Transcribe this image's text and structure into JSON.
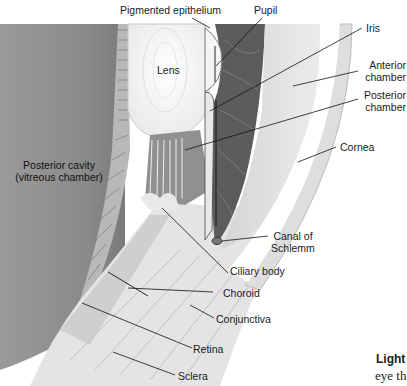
{
  "figure": {
    "labels": {
      "pigmented_epithelium": "Pigmented epithelium",
      "pupil": "Pupil",
      "iris": "Iris",
      "lens": "Lens",
      "anterior_chamber": "Anterior\nchamber",
      "anterior_chamber_l1": "Anterior",
      "anterior_chamber_l2": "chamber",
      "posterior_chamber_l1": "Posterior",
      "posterior_chamber_l2": "chamber",
      "posterior_cavity_l1": "Posterior cavity",
      "posterior_cavity_l2": "(vitreous chamber)",
      "cornea": "Cornea",
      "canal_l1": "Canal of",
      "canal_l2": "Schlemm",
      "ciliary_body": "Ciliary body",
      "choroid": "Choroid",
      "conjunctiva": "Conjunctiva",
      "retina": "Retina",
      "sclera": "Sclera"
    },
    "caption_fragment": {
      "bold": "Light",
      "text": "eye th"
    }
  }
}
